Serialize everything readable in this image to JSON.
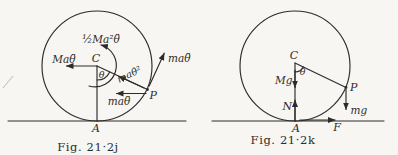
{
  "page": {
    "background_color": "#f7f6f2",
    "ink_color": "#2e2c29"
  },
  "figures": [
    {
      "caption": "Fig. 21·2j",
      "labels": {
        "center": "C",
        "contact_point": "A",
        "rim_point": "P",
        "angle": "θ",
        "inertia_couple": "½Ma²θ̈",
        "frame_inertia_force": "Maθ̈",
        "centripetal_force": "maθ̇²",
        "tangential_force": "maθ̈",
        "translation_force": "maθ̈"
      }
    },
    {
      "caption": "Fig. 21·2k",
      "labels": {
        "center": "C",
        "contact_point": "A",
        "rim_point": "P",
        "angle": "θ",
        "main_weight": "Mg",
        "normal_reaction": "N",
        "friction_force": "F",
        "particle_weight": "mg"
      }
    }
  ]
}
